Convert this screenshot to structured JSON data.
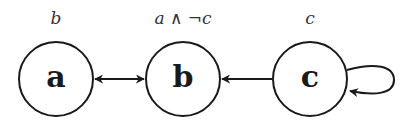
{
  "diagram": {
    "type": "state-transition-graph",
    "colors": {
      "stroke": "#1a1a1a",
      "label": "#333333",
      "background": "#ffffff"
    },
    "nodes": [
      {
        "id": "a",
        "name": "a",
        "label": "b",
        "cx": 56,
        "cy": 79,
        "r": 37
      },
      {
        "id": "b",
        "name": "b",
        "label": "a ∧ ¬c",
        "cx": 183,
        "cy": 79,
        "r": 37
      },
      {
        "id": "c",
        "name": "c",
        "label": "c",
        "cx": 310,
        "cy": 79,
        "r": 37
      }
    ],
    "edges": [
      {
        "from": "a",
        "to": "b",
        "direction": "bidirectional"
      },
      {
        "from": "c",
        "to": "b",
        "direction": "forward"
      },
      {
        "from": "c",
        "to": "c",
        "direction": "self-loop"
      }
    ]
  }
}
